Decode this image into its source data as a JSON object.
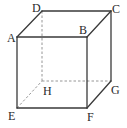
{
  "diagram": {
    "type": "cube",
    "vertices": {
      "A": {
        "label": "A",
        "x": 17,
        "y": 37
      },
      "B": {
        "label": "B",
        "x": 87,
        "y": 37
      },
      "C": {
        "label": "C",
        "x": 111,
        "y": 11
      },
      "D": {
        "label": "D",
        "x": 42,
        "y": 11
      },
      "E": {
        "label": "E",
        "x": 17,
        "y": 108
      },
      "F": {
        "label": "F",
        "x": 87,
        "y": 108
      },
      "G": {
        "label": "G",
        "x": 111,
        "y": 81
      },
      "H": {
        "label": "H",
        "x": 42,
        "y": 81
      }
    },
    "visible_edges": [
      "AB",
      "BC",
      "CD",
      "DA",
      "AE",
      "BF",
      "EF",
      "FG",
      "CG"
    ],
    "hidden_edges": [
      "DH",
      "EH",
      "HG"
    ],
    "labels": {
      "A": "A",
      "B": "B",
      "C": "C",
      "D": "D",
      "E": "E",
      "F": "F",
      "G": "G",
      "H": "H"
    }
  }
}
